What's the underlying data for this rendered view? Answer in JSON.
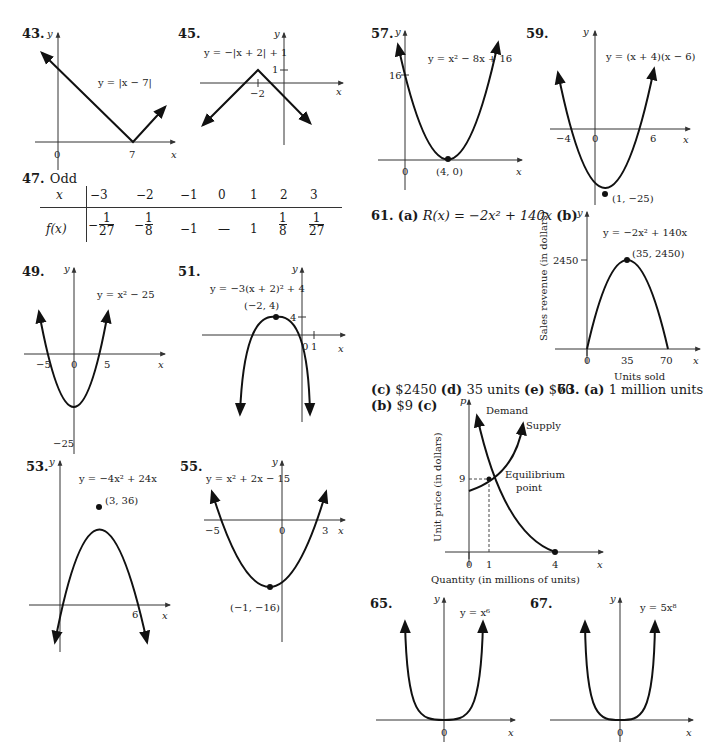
{
  "page": {
    "kind": "textbook answer key",
    "problems": [
      "43",
      "45",
      "47",
      "49",
      "51",
      "53",
      "55",
      "57",
      "59",
      "61",
      "63",
      "65",
      "67"
    ]
  },
  "p43": {
    "num": "43.",
    "eq": "y = |x − 7|",
    "ticks": [
      "0",
      "7"
    ],
    "xlabel": "x",
    "ylabel": "y"
  },
  "p45": {
    "num": "45.",
    "eq": "y = −|x + 2| + 1",
    "ticks": [
      "−2",
      "1"
    ],
    "xlabel": "x",
    "ylabel": "y"
  },
  "p47": {
    "num": "47.",
    "answer": "Odd",
    "row_x_label": "x",
    "row_f_label": "f(x)",
    "x_values": [
      "−3",
      "−2",
      "−1",
      "0",
      "1",
      "2",
      "3"
    ],
    "f_values": [
      {
        "sign": "−",
        "num": "1",
        "den": "27"
      },
      {
        "sign": "−",
        "num": "1",
        "den": "8"
      },
      {
        "plain": "−1"
      },
      {
        "plain": "—"
      },
      {
        "plain": "1"
      },
      {
        "sign": "",
        "num": "1",
        "den": "8"
      },
      {
        "sign": "",
        "num": "1",
        "den": "27"
      }
    ]
  },
  "p49": {
    "num": "49.",
    "eq": "y = x² − 25",
    "ticks": [
      "−5",
      "0",
      "5",
      "−25"
    ],
    "xlabel": "x",
    "ylabel": "y"
  },
  "p51": {
    "num": "51.",
    "eq": "y = −3(x + 2)² + 4",
    "vertex": "(−2, 4)",
    "ticks": [
      "4",
      "0",
      "1"
    ],
    "xlabel": "x",
    "ylabel": "y"
  },
  "p53": {
    "num": "53.",
    "eq": "y = −4x² + 24x",
    "vertex": "(3, 36)",
    "ticks": [
      "6"
    ],
    "xlabel": "x",
    "ylabel": "y"
  },
  "p55": {
    "num": "55.",
    "eq": "y = x² + 2x − 15",
    "vertex": "(−1, −16)",
    "ticks": [
      "−5",
      "0",
      "3"
    ],
    "xlabel": "x",
    "ylabel": "y"
  },
  "p57": {
    "num": "57.",
    "eq": "y = x² − 8x + 16",
    "vertex": "(4, 0)",
    "ticks": [
      "16",
      "0"
    ],
    "xlabel": "x",
    "ylabel": "y"
  },
  "p59": {
    "num": "59.",
    "eq": "y = (x + 4)(x − 6)",
    "vertex": "(1, −25)",
    "ticks": [
      "−4",
      "0",
      "6"
    ],
    "xlabel": "x",
    "ylabel": "y"
  },
  "p61": {
    "num": "61.",
    "a_label": "(a)",
    "a_text": "R(x) = −2x² + 140x",
    "b_label": "(b)",
    "c_label": "(c)",
    "c_text": "$2450",
    "d_label": "(d)",
    "d_text": "35 units",
    "e_label": "(e)",
    "e_text": "$70",
    "graph": {
      "eq": "y = −2x² + 140x",
      "vertex": "(35, 2450)",
      "ytick": "2450",
      "xticks": [
        "0",
        "35",
        "70"
      ],
      "xlabel": "x",
      "ylabel": "y",
      "x_title": "Units sold",
      "y_title": "Sales revenue (in dollars)"
    }
  },
  "p63": {
    "num": "63.",
    "a_label": "(a)",
    "a_text": "1 million units",
    "b_label": "(b)",
    "b_text": "$9",
    "c_label": "(c)",
    "graph": {
      "ylabel": "p",
      "xlabel": "x",
      "demand": "Demand",
      "supply": "Supply",
      "eq_line1": "Equilibrium",
      "eq_line2": "point",
      "ytick": "9",
      "xticks": [
        "0",
        "1",
        "4"
      ],
      "x_title": "Quantity (in millions of units)",
      "y_title": "Unit price (in dollars)"
    }
  },
  "p65": {
    "num": "65.",
    "eq": "y = x⁶",
    "ticks": [
      "0"
    ],
    "xlabel": "x",
    "ylabel": "y"
  },
  "p67": {
    "num": "67.",
    "eq": "y = 5x⁸",
    "ticks": [
      "0"
    ],
    "xlabel": "x",
    "ylabel": "y"
  }
}
